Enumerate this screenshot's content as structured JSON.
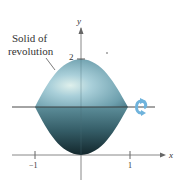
{
  "diagram": {
    "annotation": {
      "line1": "Solid of",
      "line2": "revolution"
    },
    "axes": {
      "x_label": "x",
      "y_label": "y",
      "x_ticks": [
        "−1",
        "1"
      ],
      "y_ticks": [
        "2"
      ]
    },
    "colors": {
      "solid_light": "#a9cfd9",
      "solid_mid": "#6d9fad",
      "solid_dark": "#1f3a40",
      "rotation_arrow": "#6fb3dc",
      "axis": "#777777"
    }
  }
}
